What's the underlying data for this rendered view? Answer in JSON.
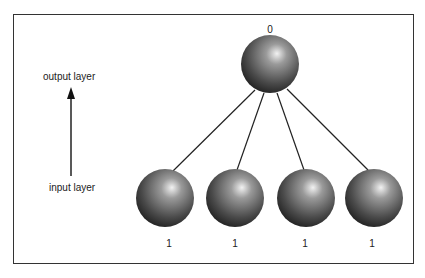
{
  "diagram": {
    "type": "neural-network-layers",
    "labels": {
      "output_layer": "output layer",
      "input_layer": "input layer"
    },
    "output_node": {
      "value": "0",
      "cx": 270,
      "cy": 64
    },
    "input_nodes": [
      {
        "value": "1",
        "cx": 165,
        "cy": 198
      },
      {
        "value": "1",
        "cx": 235,
        "cy": 198
      },
      {
        "value": "1",
        "cx": 306,
        "cy": 198
      },
      {
        "value": "1",
        "cx": 374,
        "cy": 198
      }
    ],
    "colors": {
      "border": "#333333",
      "node_dark": "#1a1a1a",
      "node_light": "#e8e8e8",
      "line": "#222222"
    }
  }
}
